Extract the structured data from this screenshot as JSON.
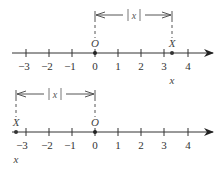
{
  "diagram": {
    "colors": {
      "line": "#333333",
      "text": "#333333",
      "bracket": "#555555"
    },
    "tick_values": [
      "−3",
      "−2",
      "−1",
      "0",
      "1",
      "2",
      "3",
      "4"
    ],
    "panels": [
      {
        "name": "positive-case",
        "origin_label": "O",
        "point_label": "X",
        "point_value": 3.35,
        "coordinate_label": "x",
        "distance_label": "|x|"
      },
      {
        "name": "negative-case",
        "origin_label": "O",
        "point_label": "X",
        "point_value": -3.45,
        "coordinate_label": "x",
        "distance_label": "|x|"
      }
    ]
  }
}
